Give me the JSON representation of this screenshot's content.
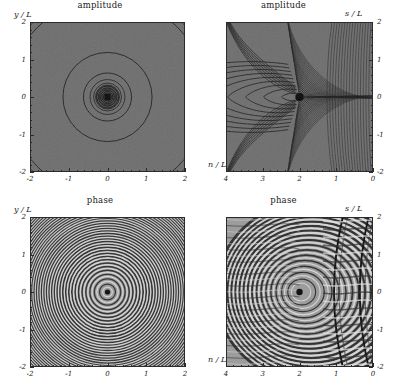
{
  "figure": {
    "width": 399,
    "height": 391,
    "background": "#ffffff",
    "field_background": "#6d6d6d",
    "contour_color": "#1a1a1a"
  },
  "panels": [
    {
      "id": "amplitude-cartesian",
      "title": "amplitude",
      "position": "top-left",
      "xlabel": "x / L",
      "ylabel": "y / L",
      "xlabel_side": "right-bottom",
      "ylabel_side": "left-top",
      "yaxis_side": "left",
      "xticks": [
        "-2",
        "-1",
        "0",
        "1",
        "2"
      ],
      "yticks": [
        "2",
        "1",
        "0",
        "-1",
        "-2"
      ],
      "xlim": [
        -2,
        2
      ],
      "ylim": [
        -2,
        2
      ],
      "minor_per_major": 5
    },
    {
      "id": "amplitude-caustic",
      "title": "amplitude",
      "position": "top-right",
      "xlabel": "n / L",
      "ylabel": "s / L",
      "xlabel_side": "left-bottom",
      "ylabel_side": "right-top",
      "yaxis_side": "right",
      "xticks": [
        "4",
        "3",
        "2",
        "1",
        "0"
      ],
      "yticks": [
        "2",
        "1",
        "0",
        "-1",
        "-2"
      ],
      "xlim": [
        4,
        0
      ],
      "ylim": [
        -2,
        2
      ],
      "minor_per_major": 5
    },
    {
      "id": "phase-cartesian",
      "title": "phase",
      "position": "bottom-left",
      "xlabel": "x / L",
      "ylabel": "y / L",
      "xlabel_side": "right-bottom",
      "ylabel_side": "left-top",
      "yaxis_side": "left",
      "xticks": [
        "-2",
        "-1",
        "0",
        "1",
        "2"
      ],
      "yticks": [
        "2",
        "1",
        "0",
        "-1",
        "-2"
      ],
      "xlim": [
        -2,
        2
      ],
      "ylim": [
        -2,
        2
      ],
      "minor_per_major": 5
    },
    {
      "id": "phase-caustic",
      "title": "phase",
      "position": "bottom-right",
      "xlabel": "n / L",
      "ylabel": "s / L",
      "xlabel_side": "left-bottom",
      "ylabel_side": "right-top",
      "yaxis_side": "right",
      "xticks": [
        "4",
        "3",
        "2",
        "1",
        "0"
      ],
      "yticks": [
        "2",
        "1",
        "0",
        "-1",
        "-2"
      ],
      "xlim": [
        4,
        0
      ],
      "ylim": [
        -2,
        2
      ],
      "minor_per_major": 5
    }
  ],
  "chart_data": {
    "type": "heatmap",
    "layout": "2x2 grid of filled contour plots",
    "panels": [
      {
        "name": "amplitude-cartesian",
        "title": "amplitude",
        "xlabel": "x / L",
        "ylabel": "y / L",
        "xlim": [
          -2,
          2
        ],
        "ylim": [
          -2,
          2
        ],
        "xticks": [
          -2,
          -1,
          0,
          1,
          2
        ],
        "yticks": [
          -2,
          -1,
          0,
          1,
          2
        ],
        "grid": false,
        "legend": "none",
        "description": "Circularly symmetric amplitude about the origin; a dark saturated core at (0,0) surrounded by concentric contour rings at radii approximately 0.12, 0.18, 0.25, 0.33, 0.45, 0.62 and 1.15 in units of L, plus corner arcs of radius about 2.55.",
        "center": [
          0,
          0
        ],
        "contour_radii": [
          0.1,
          0.14,
          0.18,
          0.23,
          0.29,
          0.36,
          0.45,
          0.62,
          1.15,
          2.55
        ]
      },
      {
        "name": "amplitude-caustic",
        "title": "amplitude",
        "xlabel": "n / L",
        "ylabel": "s / L",
        "xlim": [
          4,
          0
        ],
        "ylim": [
          -2,
          2
        ],
        "xticks": [
          4,
          3,
          2,
          1,
          0
        ],
        "yticks": [
          -2,
          -1,
          0,
          1,
          2
        ],
        "grid": false,
        "legend": "none",
        "description": "Cusp-caustic amplitude map. A dark singular focus sits at n/L = 2, s/L = 0. Nested cusp-shaped contours open toward increasing n. Two caustic fold branches sweep away from the focus toward the upper-left and lower-left corners, and fringe lobes crowd toward the right edge at n/L = 0.",
        "focus": [
          2,
          0
        ],
        "caustic_branches": [
          "upper-left fold",
          "lower-left fold"
        ]
      },
      {
        "name": "phase-cartesian",
        "title": "phase",
        "xlabel": "x / L",
        "ylabel": "y / L",
        "xlim": [
          -2,
          2
        ],
        "ylim": [
          -2,
          2
        ],
        "xticks": [
          -2,
          -1,
          0,
          1,
          2
        ],
        "yticks": [
          -2,
          -1,
          0,
          1,
          2
        ],
        "grid": false,
        "legend": "none",
        "description": "Dense concentric phase fringes radiating from a dark point at the origin; fringe spacing decreases with radius giving roughly 40 visible rings out to the frame edge.",
        "center": [
          0,
          0
        ],
        "ring_count": 40
      },
      {
        "name": "phase-caustic",
        "title": "phase",
        "xlabel": "n / L",
        "ylabel": "s / L",
        "xlim": [
          4,
          0
        ],
        "ylim": [
          -2,
          2
        ],
        "xticks": [
          4,
          3,
          2,
          1,
          0
        ],
        "yticks": [
          -2,
          -1,
          0,
          1,
          2
        ],
        "grid": false,
        "legend": "none",
        "description": "Phase fringes circulate around a dark point at n/L = 2, s/L = 0 and are distorted into cusp lobes toward the right. Two strong near-vertical caustic lines run top-to-bottom at about n/L = 1.0 and n/L = 0.3, separating regions of differing fringe slope.",
        "focus": [
          2,
          0
        ],
        "vertical_caustics": [
          1.0,
          0.3
        ]
      }
    ]
  }
}
